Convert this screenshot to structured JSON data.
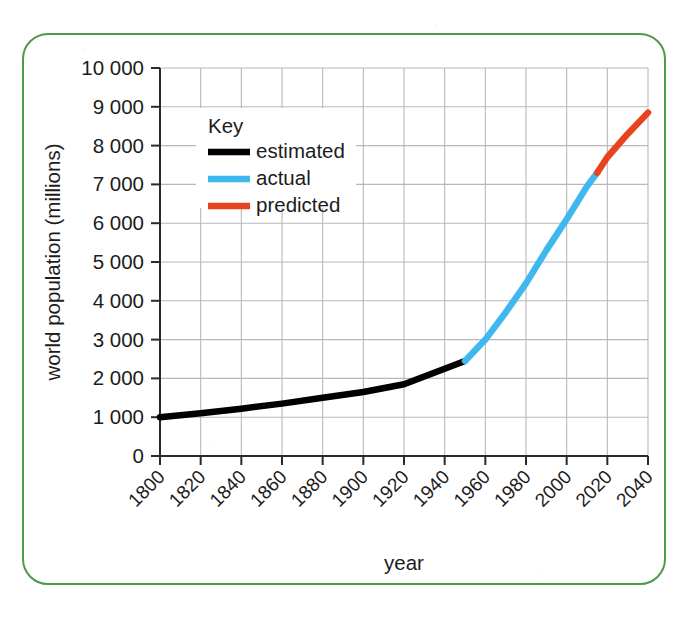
{
  "figure": {
    "border_color": "#4c9a4c",
    "background_color": "#ffffff"
  },
  "axes": {
    "y_title": "world population (millions)",
    "x_title": "year",
    "y_ticks": [
      "0",
      "1 000",
      "2 000",
      "3 000",
      "4 000",
      "5 000",
      "6 000",
      "7 000",
      "8 000",
      "9 000",
      "10 000"
    ],
    "x_ticks": [
      "1800",
      "1820",
      "1840",
      "1860",
      "1880",
      "1900",
      "1920",
      "1940",
      "1960",
      "1980",
      "2000",
      "2020",
      "2040"
    ],
    "grid_color": "#b8b8b8",
    "axis_color": "#2a2a2a"
  },
  "legend": {
    "title": "Key",
    "items": [
      {
        "label": "estimated",
        "color": "#000000"
      },
      {
        "label": "actual",
        "color": "#3fb8ef"
      },
      {
        "label": "predicted",
        "color": "#e8431f"
      }
    ]
  },
  "chart_data": {
    "type": "line",
    "title": "",
    "xlabel": "year",
    "ylabel": "world population (millions)",
    "xlim": [
      1800,
      2040
    ],
    "ylim": [
      0,
      10000
    ],
    "xticks": [
      1800,
      1820,
      1840,
      1860,
      1880,
      1900,
      1920,
      1940,
      1960,
      1980,
      2000,
      2020,
      2040
    ],
    "yticks": [
      0,
      1000,
      2000,
      3000,
      4000,
      5000,
      6000,
      7000,
      8000,
      9000,
      10000
    ],
    "grid": true,
    "legend_position": "upper-left-inside",
    "series": [
      {
        "name": "estimated",
        "color": "#000000",
        "x": [
          1800,
          1820,
          1840,
          1860,
          1880,
          1900,
          1920,
          1940,
          1950
        ],
        "values": [
          1000,
          1100,
          1220,
          1350,
          1500,
          1650,
          1850,
          2250,
          2450
        ]
      },
      {
        "name": "actual",
        "color": "#3fb8ef",
        "x": [
          1950,
          1960,
          1970,
          1980,
          1990,
          2000,
          2010,
          2015
        ],
        "values": [
          2450,
          3000,
          3700,
          4450,
          5300,
          6100,
          6950,
          7300
        ]
      },
      {
        "name": "predicted",
        "color": "#e8431f",
        "x": [
          2015,
          2020,
          2030,
          2040
        ],
        "values": [
          7300,
          7700,
          8300,
          8850
        ]
      }
    ]
  }
}
